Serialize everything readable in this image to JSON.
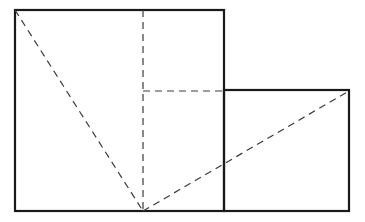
{
  "diagram": {
    "type": "geometry-figure",
    "colors": {
      "solid_stroke": "#1a1a1a",
      "dashed_stroke": "#3a3a3a",
      "background": "#ffffff"
    },
    "shapes": {
      "large_square": {
        "x": 15,
        "y": 10,
        "width": 209,
        "height": 201
      },
      "small_rectangle": {
        "x": 224,
        "y": 90,
        "width": 125,
        "height": 121
      }
    },
    "dashed_lines": [
      {
        "name": "diagonal-left",
        "x1": 15,
        "y1": 10,
        "x2": 143,
        "y2": 211
      },
      {
        "name": "vertical-mid",
        "x1": 143,
        "y1": 10,
        "x2": 143,
        "y2": 211
      },
      {
        "name": "horizontal-mid",
        "x1": 143,
        "y1": 91,
        "x2": 224,
        "y2": 91
      },
      {
        "name": "diagonal-right",
        "x1": 143,
        "y1": 211,
        "x2": 349,
        "y2": 91
      }
    ]
  }
}
